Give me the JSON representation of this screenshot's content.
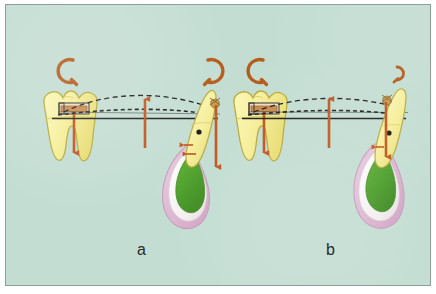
{
  "figure": {
    "background_color": "#c3ddd2",
    "border_color": "#8e9e98",
    "panels": [
      {
        "id": "a",
        "label": "a",
        "description": "Anchor molar with bracket tube and deflected archwire delivering extrusive force to an impacted canine; large canine rotation moment"
      },
      {
        "id": "b",
        "label": "b",
        "description": "Anchor molar with bracket tube and flatter archwire delivering extrusive force to a more upright impacted canine; reduced canine rotation moment"
      }
    ]
  },
  "colors": {
    "background": "#c3ddd2",
    "frame_border": "#8e9e98",
    "tooth_enamel": "#f6f09a",
    "tooth_enamel_shade": "#e9e07a",
    "tooth_outline": "#b8ad3a",
    "root_green": "#4a9e27",
    "follicle_white": "#f4f1ef",
    "bone_pink": "#dcb6cf",
    "bone_pink_light": "#ecd7e6",
    "force_arrow": "#c0531a",
    "moment_arrow": "#b45a18",
    "bracket_fill": "#c98a4a",
    "wire_solid": "#1b1b1b",
    "wire_dashed": "#1b1b1b",
    "label_text": "#2a2a2a",
    "attachment_gold": "#c79a4e"
  },
  "annotations": {
    "molar_bracket_name": "buccal-tube-bracket",
    "canine_attachment_name": "bonded-button-attachment",
    "rotation_symbol": "curved-moment-arrow",
    "force_symbol": "straight-force-arrow",
    "archwire_passive": "solid-straight-archwire",
    "archwire_active": "dashed-deflected-archwire"
  },
  "elements": {
    "panel_a": {
      "molar_moment_label": "counterclockwise moment on molar",
      "canine_moment_label": "clockwise moment on canine",
      "molar_force_label": "intrusive reaction force on molar",
      "midspan_force_label": "upward force vector",
      "canine_force_label": "extrusive traction force on canine"
    },
    "panel_b": {
      "molar_moment_label": "counterclockwise moment on molar",
      "canine_moment_label": "small clockwise moment on canine",
      "molar_force_label": "intrusive reaction force on molar",
      "midspan_force_label": "upward force vector",
      "canine_force_label": "extrusive traction force on canine"
    }
  }
}
